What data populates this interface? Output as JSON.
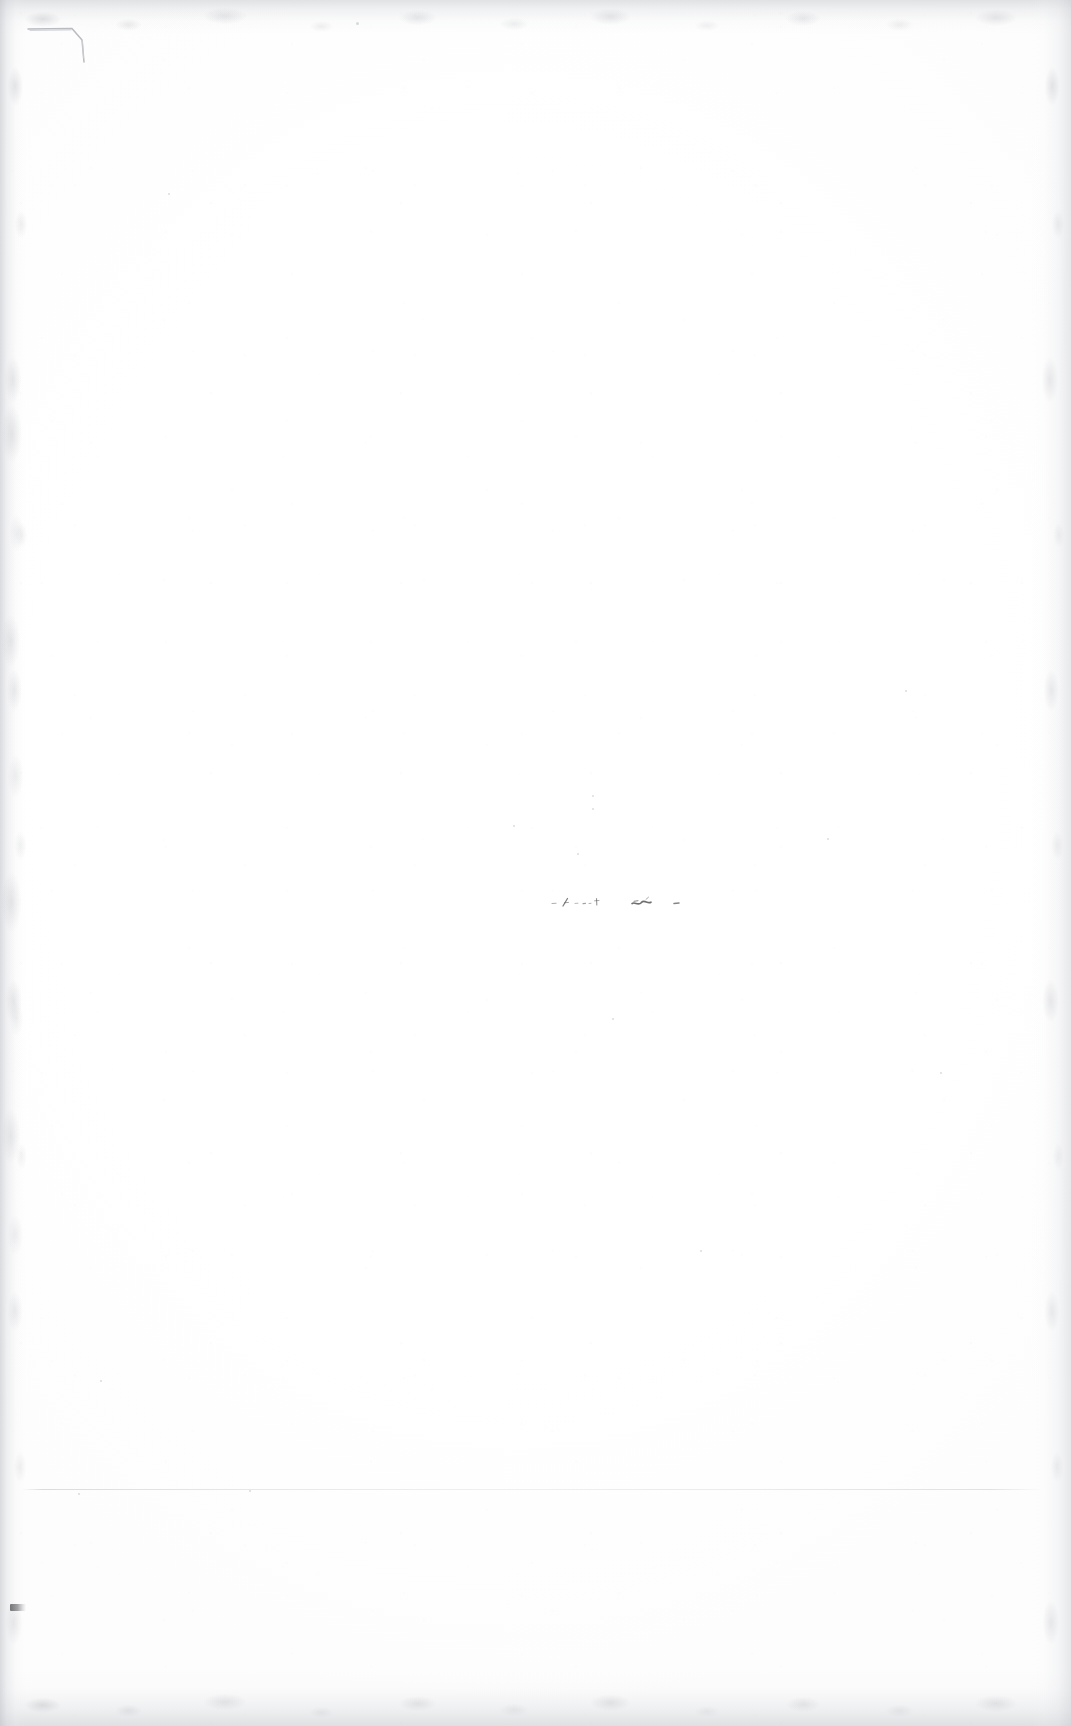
{
  "document": {
    "kind": "scanned-page",
    "description": "Blank scanned book page",
    "visible_text": "",
    "page_width_px": 1071,
    "page_height_px": 1726,
    "background_color": "#fefefe",
    "paper_color": "#ffffff"
  },
  "artifacts": {
    "dog_ear": {
      "label": "folded corner crease",
      "position": "top-left",
      "x": 26,
      "y": 14,
      "width": 70,
      "height": 52,
      "stroke_color": "#b9bbc0"
    },
    "ink_traces": {
      "label": "faint illegible ink traces",
      "text": "",
      "position": "center",
      "x": 548,
      "y": 884,
      "width": 160,
      "height": 34,
      "ink_color": "#4a4a4e",
      "legible": "no"
    },
    "hairline_rule": {
      "label": "faint horizontal rule",
      "x": 22,
      "y": 1489,
      "width": 1020,
      "color": "#b6b8bd"
    },
    "corner_tick": {
      "label": "small dark tick mark",
      "position": "bottom-left margin",
      "x": 10,
      "y": 1604,
      "width": 16,
      "height": 7,
      "color": "#46464a"
    },
    "scan_edges": {
      "label": "scanner edge shadow bands",
      "edges": [
        "top",
        "bottom",
        "left",
        "right"
      ],
      "haze_color": "#c4c6ca"
    },
    "specks": [
      {
        "x": 356,
        "y": 22,
        "size": 3
      },
      {
        "x": 592,
        "y": 808,
        "size": 2
      },
      {
        "x": 592,
        "y": 795,
        "size": 2
      },
      {
        "x": 513,
        "y": 825,
        "size": 2
      },
      {
        "x": 577,
        "y": 853,
        "size": 2
      },
      {
        "x": 612,
        "y": 1018,
        "size": 2
      },
      {
        "x": 827,
        "y": 838,
        "size": 2
      },
      {
        "x": 168,
        "y": 193,
        "size": 2
      },
      {
        "x": 940,
        "y": 1072,
        "size": 2
      },
      {
        "x": 78,
        "y": 1493,
        "size": 2
      },
      {
        "x": 249,
        "y": 1490,
        "size": 2
      },
      {
        "x": 100,
        "y": 1380,
        "size": 2
      },
      {
        "x": 905,
        "y": 690,
        "size": 2
      },
      {
        "x": 700,
        "y": 1250,
        "size": 2
      }
    ]
  }
}
